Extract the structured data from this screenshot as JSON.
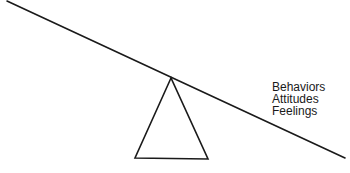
{
  "diagram": {
    "type": "seesaw",
    "beam": {
      "x1": 7,
      "y1": 1,
      "x2": 345,
      "y2": 158
    },
    "fulcrum": {
      "apex": [
        171,
        78
      ],
      "base_left": [
        135,
        158
      ],
      "base_right": [
        208,
        159
      ]
    },
    "stroke_color": "#1a1a1a",
    "labels": [
      "Behaviors",
      "Attitudes",
      "Feelings"
    ]
  }
}
